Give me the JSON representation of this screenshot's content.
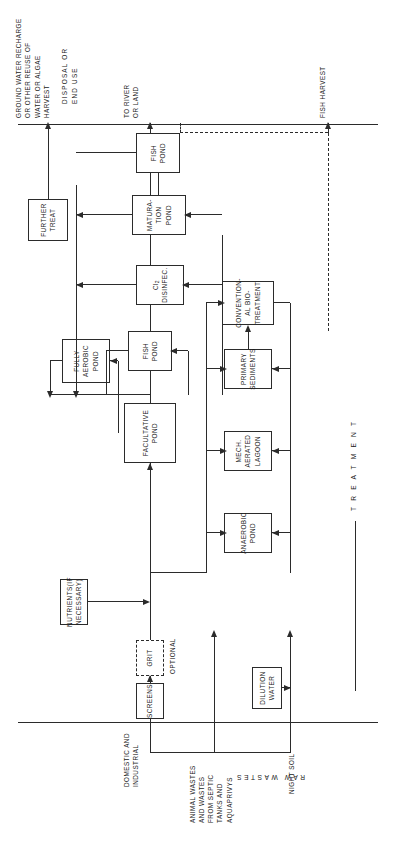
{
  "diagram": {
    "axes": {
      "left_axis_label": "RAW WASTES",
      "right_axis_label": "DISPOSAL OR\nEND USE",
      "flow_axis_label": "T R E A T M E N T"
    },
    "inputs": [
      {
        "id": "domestic",
        "label": "DOMESTIC AND\nINDUSTRIAL"
      },
      {
        "id": "animal",
        "label": "ANIMAL WASTES\nAND WASTES\nFROM SEPTIC\nTANKS AND\nAQUAPRIVYS"
      },
      {
        "id": "night-soil",
        "label": "NIGHT SOIL"
      }
    ],
    "outputs": [
      {
        "id": "to-river",
        "label": "TO RIVER\nOR LAND"
      },
      {
        "id": "ground-water",
        "label": "GROUND WATER RECHARGE\nOR OTHER REUSE OF\nWATER OR ALGAE\nHARVEST"
      },
      {
        "id": "fish-harvest",
        "label": "FISH HARVEST"
      }
    ],
    "boxes": [
      {
        "id": "screens",
        "label": "SCREENS",
        "style": "solid"
      },
      {
        "id": "grit",
        "label": "GRIT",
        "style": "dashed"
      },
      {
        "id": "dilution-water",
        "label": "DILUTION\nWATER",
        "style": "solid"
      },
      {
        "id": "nutrients",
        "label": "NUTRIENTS(IF\nNECESSARY)",
        "style": "solid"
      },
      {
        "id": "anaerobic-pond",
        "label": "ANAEROBIC\nPOND",
        "style": "solid"
      },
      {
        "id": "mech-aerated-lagoon",
        "label": "MECH.\nAERATED\nLAGOON",
        "style": "solid"
      },
      {
        "id": "primary-sediments",
        "label": "PRIMARY\nSEDIMENTS",
        "style": "solid"
      },
      {
        "id": "conventional-bio-treatment",
        "label": "CONVENTION-\nAL  BIO-\nTREATMENT",
        "style": "solid"
      },
      {
        "id": "facultative-pond",
        "label": "FACULTATIVE\nPOND",
        "style": "solid"
      },
      {
        "id": "fully-aerobic-pond",
        "label": "FULLY\nAEROBIC\nPOND",
        "style": "solid"
      },
      {
        "id": "fish-pond-1",
        "label": "FISH\nPOND",
        "style": "solid"
      },
      {
        "id": "cl2-disinfec",
        "label": "Cl₂\nDISINFEC.",
        "style": "solid"
      },
      {
        "id": "maturation-pond",
        "label": "MATURA-\nTION\nPOND",
        "style": "solid"
      },
      {
        "id": "fish-pond-2",
        "label": "FISH\nPOND",
        "style": "solid"
      },
      {
        "id": "further-treat",
        "label": "FURTHER\nTREAT",
        "style": "solid"
      }
    ],
    "annotations": [
      {
        "id": "optional",
        "label": "OPTIONAL"
      }
    ],
    "colors": {
      "ink": "#2b2b2b",
      "paper": "#ffffff"
    }
  }
}
